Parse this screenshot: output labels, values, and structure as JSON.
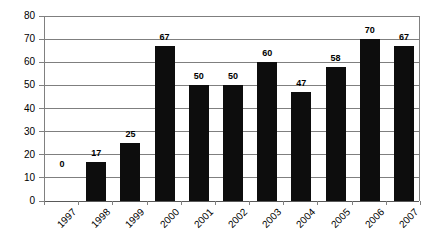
{
  "chart_data": {
    "type": "bar",
    "title": "",
    "subtitle": "",
    "xlabel": "",
    "ylabel": "",
    "categories": [
      "1997",
      "1998",
      "1999",
      "2000",
      "2001",
      "2002",
      "2003",
      "2004",
      "2005",
      "2006",
      "2007"
    ],
    "values": [
      0,
      17,
      25,
      67,
      50,
      50,
      60,
      47,
      58,
      70,
      67
    ],
    "data_labels": [
      "0",
      "17",
      "25",
      "67",
      "50",
      "50",
      "60",
      "47",
      "58",
      "70",
      "67"
    ],
    "ylim": [
      0,
      80
    ],
    "ytick_values": [
      0,
      10,
      20,
      30,
      40,
      50,
      60,
      70,
      80
    ],
    "ytick_labels": [
      "0",
      "10",
      "20",
      "30",
      "40",
      "50",
      "60",
      "70",
      "80"
    ],
    "grid": true,
    "grid_axis": "y",
    "legend": false,
    "legend_position": "none",
    "bar_color": "#0d0d0d",
    "gridline_color": "#7f7f7f",
    "axis_color": "#808080",
    "background_color": "#ffffff",
    "text_color": "#000000",
    "xtick_label_rotation": -45,
    "annotations": []
  }
}
